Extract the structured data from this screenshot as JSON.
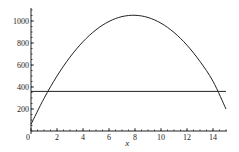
{
  "chart_data": {
    "type": "line",
    "title": "",
    "xlabel": "x",
    "ylabel": "",
    "xlim": [
      0,
      15
    ],
    "ylim": [
      0,
      1100
    ],
    "xticks": [
      0,
      2,
      4,
      6,
      8,
      10,
      12,
      14
    ],
    "xtick_labels": [
      "0",
      "2",
      "4",
      "6",
      "8",
      "10",
      "12",
      "14"
    ],
    "yticks": [
      200,
      400,
      600,
      800,
      1000
    ],
    "ytick_labels": [
      "200",
      "400",
      "600",
      "800",
      "1000"
    ],
    "grid": false,
    "legend": "none",
    "series": [
      {
        "name": "curve",
        "x": [
          0,
          1,
          2,
          3,
          4,
          5,
          6,
          7,
          8,
          9,
          10,
          11,
          12,
          13,
          14,
          15
        ],
        "y": [
          60,
          296,
          500,
          672,
          812,
          920,
          996,
          1040,
          1052,
          1032,
          980,
          896,
          780,
          632,
          452,
          200
        ]
      },
      {
        "name": "horizontal-line",
        "x": [
          0,
          15
        ],
        "y": [
          360,
          360
        ]
      }
    ]
  }
}
